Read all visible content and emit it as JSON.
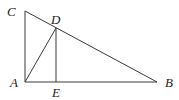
{
  "diagram": {
    "type": "geometry",
    "points": {
      "A": {
        "label": "A"
      },
      "B": {
        "label": "B"
      },
      "C": {
        "label": "C"
      },
      "D": {
        "label": "D"
      },
      "E": {
        "label": "E"
      }
    },
    "segments": [
      {
        "id": "CA",
        "from": "C",
        "to": "A"
      },
      {
        "id": "AB",
        "from": "A",
        "to": "B"
      },
      {
        "id": "CB",
        "from": "C",
        "to": "B"
      },
      {
        "id": "AD",
        "from": "A",
        "to": "D"
      },
      {
        "id": "DE",
        "from": "D",
        "to": "E"
      }
    ]
  }
}
